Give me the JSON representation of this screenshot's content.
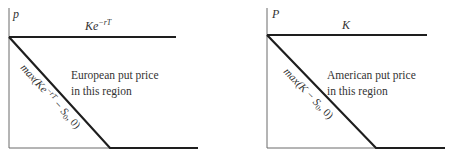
{
  "diagram": {
    "panels": [
      {
        "id": "european",
        "y_axis_label": "p",
        "upper_bound_label": "Ke",
        "upper_bound_exponent": "−rT",
        "lower_bound_label_prefix": "max(",
        "lower_bound_label_K": "Ke",
        "lower_bound_label_exp": "−rT",
        "lower_bound_label_mid": " − S",
        "lower_bound_label_sub": "0",
        "lower_bound_label_suffix": ", 0)",
        "region_text_line1": "European put price",
        "region_text_line2": "in this region"
      },
      {
        "id": "american",
        "y_axis_label": "P",
        "upper_bound_label": "K",
        "lower_bound_label_prefix": "max(",
        "lower_bound_label_K": "K",
        "lower_bound_label_mid": " − S",
        "lower_bound_label_sub": "0",
        "lower_bound_label_suffix": ", 0)",
        "region_text_line1": "American put price",
        "region_text_line2": "in this region"
      }
    ],
    "colors": {
      "axis": "#6a6a6a",
      "bound_line": "#1e1e1e",
      "text": "#333333"
    }
  }
}
